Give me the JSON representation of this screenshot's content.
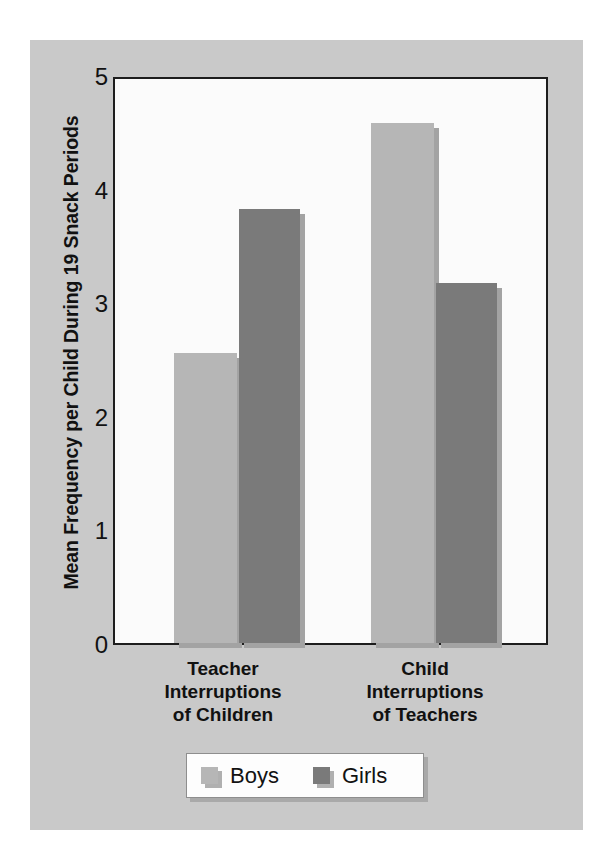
{
  "chart_data": {
    "type": "bar",
    "title": "",
    "xlabel": "",
    "ylabel": "Mean Frequency per Child During 19 Snack Periods",
    "categories": [
      "Teacher\nInterruptions\nof Children",
      "Child\nInterruptions\nof Teachers"
    ],
    "series": [
      {
        "name": "Boys",
        "color": "#b6b6b6",
        "values": [
          2.55,
          4.58
        ]
      },
      {
        "name": "Girls",
        "color": "#7a7a7a",
        "values": [
          3.82,
          3.17
        ]
      }
    ],
    "ylim": [
      0,
      5
    ],
    "yticks": [
      0,
      1,
      2,
      3,
      4,
      5
    ],
    "ytick_labels": [
      "0",
      "1",
      "2",
      "3",
      "4",
      "5"
    ],
    "grid": false,
    "legend_position": "bottom",
    "legend_entries": [
      "Boys",
      "Girls"
    ]
  },
  "axis": {
    "y_title": "Mean Frequency per Child During 19 Snack Periods",
    "tick_0": "0",
    "tick_1": "1",
    "tick_2": "2",
    "tick_3": "3",
    "tick_4": "4",
    "tick_5": "5"
  },
  "groups": {
    "group_0_label": "Teacher\nInterruptions\nof Children",
    "group_1_label": "Child\nInterruptions\nof Teachers"
  },
  "legend": {
    "boys_label": "Boys",
    "girls_label": "Girls"
  }
}
